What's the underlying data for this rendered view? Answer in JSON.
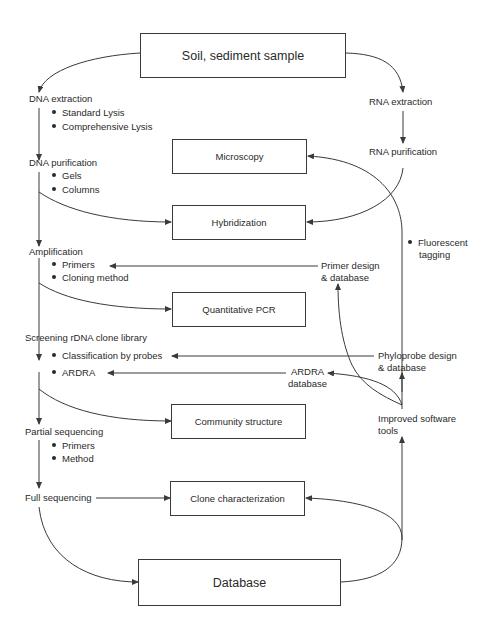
{
  "boxes": {
    "sample": "Soil, sediment sample",
    "microscopy": "Microscopy",
    "hybridization": "Hybridization",
    "qpcr": "Quantitative PCR",
    "community": "Community structure",
    "clone_char": "Clone characterization",
    "database": "Database"
  },
  "left_steps": {
    "dna_extraction": {
      "label": "DNA extraction",
      "bullets": [
        "Standard Lysis",
        "Comprehensive Lysis"
      ]
    },
    "dna_purification": {
      "label": "DNA purification",
      "bullets": [
        "Gels",
        "Columns"
      ]
    },
    "amplification": {
      "label": "Amplification",
      "bullets": [
        "Primers",
        "Cloning method"
      ]
    },
    "screening": {
      "label": "Screening rDNA clone library",
      "bullets": [
        "Classification by probes",
        "ARDRA"
      ]
    },
    "partial_seq": {
      "label": "Partial sequencing",
      "bullets": [
        "Primers",
        "Method"
      ]
    },
    "full_seq": {
      "label": "Full sequencing"
    }
  },
  "right_steps": {
    "rna_extraction": "RNA extraction",
    "rna_purification": "RNA purification",
    "fluorescent": [
      "Fluorescent",
      "tagging"
    ],
    "primer_design": [
      "Primer design",
      "& database"
    ],
    "phyloprobe": [
      "Phyloprobe design",
      "& database"
    ],
    "ardra_db": [
      "ARDRA",
      "database"
    ],
    "software": [
      "Improved software",
      "tools"
    ]
  },
  "colors": {
    "line": "#3a3a3a",
    "text": "#2a2a2a",
    "background": "#ffffff"
  }
}
